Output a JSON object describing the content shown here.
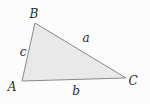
{
  "figure": {
    "background": "#fcfcfc",
    "triangle": {
      "points": "35,23 126,78 22,81",
      "fill": "#e9e9e9",
      "stroke": "#8a8a8a",
      "stroke_width": "1"
    },
    "label_color": "#2b2b2b",
    "vertex_labels": [
      {
        "text": "B",
        "x": "34",
        "y": "18"
      },
      {
        "text": "C",
        "x": "133",
        "y": "85"
      },
      {
        "text": "A",
        "x": "12",
        "y": "91"
      }
    ],
    "side_labels": [
      {
        "text": "a",
        "x": "86",
        "y": "42"
      },
      {
        "text": "b",
        "x": "76",
        "y": "95"
      },
      {
        "text": "c",
        "x": "23",
        "y": "56"
      }
    ]
  }
}
